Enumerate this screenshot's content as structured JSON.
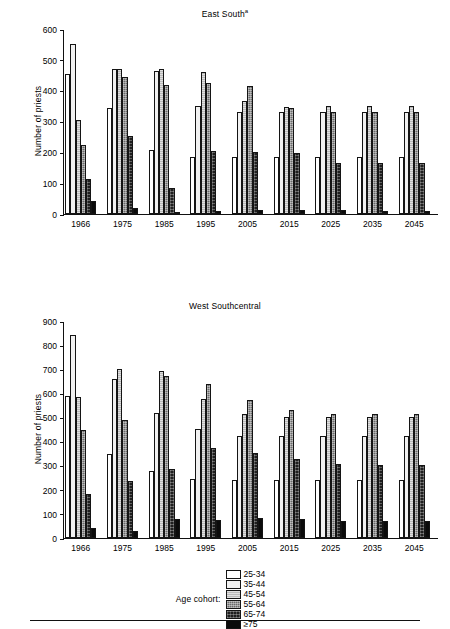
{
  "legend": {
    "title": "Age cohort:",
    "items": [
      {
        "label": "25-34",
        "swatch": "white-swatch"
      },
      {
        "label": "35-44",
        "swatch": "light-gray-swatch"
      },
      {
        "label": "45-54",
        "swatch": "medium-gray-swatch"
      },
      {
        "label": "55-64",
        "swatch": "dark-gray-textured-swatch"
      },
      {
        "label": "65-74",
        "swatch": "very-dark-textured-swatch"
      },
      {
        "label": "≥75",
        "swatch": "black-swatch"
      }
    ]
  },
  "chart_data": [
    {
      "type": "bar",
      "title": "East South",
      "title_superscript": "a",
      "xlabel": "",
      "ylabel": "Number of priests",
      "ylim": [
        0,
        600
      ],
      "yticks": [
        0,
        100,
        200,
        300,
        400,
        500,
        600
      ],
      "grid": false,
      "legend_position": "bottom",
      "categories": [
        "1966",
        "1975",
        "1985",
        "1995",
        "2005",
        "2015",
        "2025",
        "2035",
        "2045"
      ],
      "series": [
        {
          "name": "25-34",
          "values": [
            455,
            343,
            209,
            184,
            184,
            184,
            184,
            184,
            184
          ]
        },
        {
          "name": "35-44",
          "values": [
            550,
            470,
            465,
            350,
            330,
            331,
            331,
            331,
            331
          ]
        },
        {
          "name": "45-54",
          "values": [
            306,
            470,
            470,
            460,
            366,
            348,
            350,
            350,
            350
          ]
        },
        {
          "name": "55-64",
          "values": [
            224,
            444,
            419,
            425,
            414,
            344,
            331,
            331,
            331
          ]
        },
        {
          "name": "65-74",
          "values": [
            113,
            254,
            83,
            204,
            200,
            199,
            164,
            164,
            164
          ]
        },
        {
          "name": "≥75",
          "values": [
            43,
            19,
            5,
            10,
            13,
            13,
            13,
            10,
            10
          ]
        }
      ]
    },
    {
      "type": "bar",
      "title": "West Southcentral",
      "title_superscript": "",
      "xlabel": "",
      "ylabel": "Number of priests",
      "ylim": [
        0,
        900
      ],
      "yticks": [
        0,
        100,
        200,
        300,
        400,
        500,
        600,
        700,
        800,
        900
      ],
      "grid": false,
      "legend_position": "bottom",
      "categories": [
        "1966",
        "1975",
        "1985",
        "1995",
        "2005",
        "2015",
        "2025",
        "2035",
        "2045"
      ],
      "series": [
        {
          "name": "25-34",
          "values": [
            590,
            349,
            279,
            244,
            241,
            241,
            240,
            240,
            240
          ]
        },
        {
          "name": "35-44",
          "values": [
            840,
            660,
            517,
            453,
            423,
            423,
            423,
            423,
            423
          ]
        },
        {
          "name": "45-54",
          "values": [
            584,
            699,
            694,
            577,
            516,
            500,
            501,
            501,
            501
          ]
        },
        {
          "name": "55-64",
          "values": [
            450,
            489,
            673,
            639,
            571,
            530,
            515,
            515,
            515
          ]
        },
        {
          "name": "65-74",
          "values": [
            183,
            238,
            288,
            374,
            352,
            326,
            307,
            302,
            302
          ]
        },
        {
          "name": "≥75",
          "values": [
            42,
            28,
            79,
            74,
            83,
            77,
            72,
            71,
            71
          ]
        }
      ]
    }
  ]
}
